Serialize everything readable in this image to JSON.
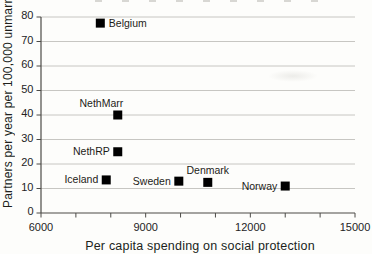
{
  "chart_data": {
    "type": "scatter",
    "title": "",
    "xlabel": "Per capita spending on social protection",
    "ylabel": "Partners per year per 100,000 unmarried",
    "xlim": [
      6000,
      15000
    ],
    "ylim": [
      0,
      80
    ],
    "x_major_ticks": [
      6000,
      9000,
      12000,
      15000
    ],
    "x_minor_tick_step": 1000,
    "y_tick_step": 10,
    "grid": "horizontal-gridlines",
    "legend": "none",
    "marker": {
      "shape": "filled-square",
      "color": "#000000",
      "size": 9
    },
    "colors": {
      "grid": "#c7c6c2",
      "axis": "#4c4b47",
      "tick_text": "#24231f",
      "label_text": "#201f1b",
      "background": "#fdfdfb"
    },
    "points": [
      {
        "name": "Belgium",
        "x": 7700,
        "y": 77.5,
        "label_pos": "right"
      },
      {
        "name": "NethMarr",
        "x": 8200,
        "y": 40,
        "label_pos": "above-left"
      },
      {
        "name": "NethRP",
        "x": 8200,
        "y": 25,
        "label_pos": "left"
      },
      {
        "name": "Iceland",
        "x": 7870,
        "y": 13.5,
        "label_pos": "left"
      },
      {
        "name": "Sweden",
        "x": 9950,
        "y": 13,
        "label_pos": "left"
      },
      {
        "name": "Denmark",
        "x": 10780,
        "y": 12.5,
        "label_pos": "above"
      },
      {
        "name": "Norway",
        "x": 13000,
        "y": 11,
        "label_pos": "left"
      }
    ]
  }
}
